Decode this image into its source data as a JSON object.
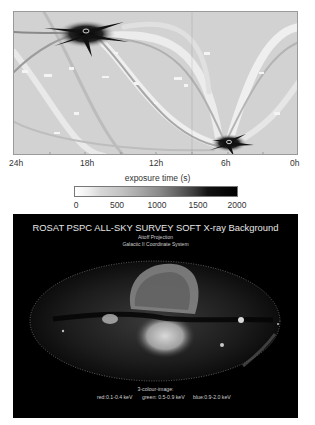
{
  "exposure_map": {
    "x_axis_labels": [
      "24h",
      "18h",
      "12h",
      "6h",
      "0h"
    ],
    "colorbar": {
      "title": "exposure time (s)",
      "ticks": [
        "0",
        "500",
        "1000",
        "1500",
        "2000"
      ],
      "range": [
        0,
        2000
      ],
      "colors": [
        "#ffffff",
        "#000000"
      ]
    }
  },
  "xray_map": {
    "title": "ROSAT PSPC ALL-SKY SURVEY SOFT X-ray Background",
    "projection": "Aitoff Projection",
    "coordinate_system": "Galactic II Coordinate System",
    "legend": {
      "title": "3-colour-image:",
      "red": "red:0.1-0.4 keV",
      "green": "green: 0.5-0.9 keV",
      "blue": "blue:0.9-2.0 keV"
    },
    "background_color": "#000000"
  }
}
